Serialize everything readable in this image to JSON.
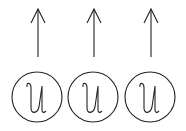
{
  "diagram": {
    "stroke_color": "#222222",
    "background": "#ffffff",
    "nodes": [
      {
        "label": "u",
        "cx": 37,
        "cy": 97,
        "r": 25,
        "arrow": "up"
      },
      {
        "label": "u",
        "cx": 93,
        "cy": 97,
        "r": 25,
        "arrow": "up"
      },
      {
        "label": "u",
        "cx": 150,
        "cy": 97,
        "r": 25,
        "arrow": "up"
      }
    ]
  }
}
